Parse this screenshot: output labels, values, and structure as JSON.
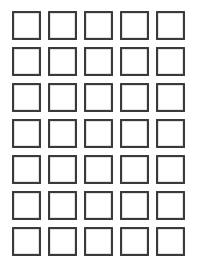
{
  "sheet": {
    "title": "Blank Square Grid Sheet",
    "background_color": "#ffffff",
    "width": 198,
    "height": 276
  },
  "grid": {
    "columns": 5,
    "rows": 7,
    "total_cells": 35,
    "cell_width": 29,
    "cell_height": 29,
    "column_gap": 7,
    "row_gap": 7,
    "origin_x": 12,
    "origin_y": 11,
    "border_color": "#3a3a3a",
    "border_width": 2,
    "cell_fill_color": "#ffffff",
    "cells": [
      {
        "row": 1,
        "col": 1,
        "label": ""
      },
      {
        "row": 1,
        "col": 2,
        "label": ""
      },
      {
        "row": 1,
        "col": 3,
        "label": ""
      },
      {
        "row": 1,
        "col": 4,
        "label": ""
      },
      {
        "row": 1,
        "col": 5,
        "label": ""
      },
      {
        "row": 2,
        "col": 1,
        "label": ""
      },
      {
        "row": 2,
        "col": 2,
        "label": ""
      },
      {
        "row": 2,
        "col": 3,
        "label": ""
      },
      {
        "row": 2,
        "col": 4,
        "label": ""
      },
      {
        "row": 2,
        "col": 5,
        "label": ""
      },
      {
        "row": 3,
        "col": 1,
        "label": ""
      },
      {
        "row": 3,
        "col": 2,
        "label": ""
      },
      {
        "row": 3,
        "col": 3,
        "label": ""
      },
      {
        "row": 3,
        "col": 4,
        "label": ""
      },
      {
        "row": 3,
        "col": 5,
        "label": ""
      },
      {
        "row": 4,
        "col": 1,
        "label": ""
      },
      {
        "row": 4,
        "col": 2,
        "label": ""
      },
      {
        "row": 4,
        "col": 3,
        "label": ""
      },
      {
        "row": 4,
        "col": 4,
        "label": ""
      },
      {
        "row": 4,
        "col": 5,
        "label": ""
      },
      {
        "row": 5,
        "col": 1,
        "label": ""
      },
      {
        "row": 5,
        "col": 2,
        "label": ""
      },
      {
        "row": 5,
        "col": 3,
        "label": ""
      },
      {
        "row": 5,
        "col": 4,
        "label": ""
      },
      {
        "row": 5,
        "col": 5,
        "label": ""
      },
      {
        "row": 6,
        "col": 1,
        "label": ""
      },
      {
        "row": 6,
        "col": 2,
        "label": ""
      },
      {
        "row": 6,
        "col": 3,
        "label": ""
      },
      {
        "row": 6,
        "col": 4,
        "label": ""
      },
      {
        "row": 6,
        "col": 5,
        "label": ""
      },
      {
        "row": 7,
        "col": 1,
        "label": ""
      },
      {
        "row": 7,
        "col": 2,
        "label": ""
      },
      {
        "row": 7,
        "col": 3,
        "label": ""
      },
      {
        "row": 7,
        "col": 4,
        "label": ""
      },
      {
        "row": 7,
        "col": 5,
        "label": ""
      }
    ]
  }
}
